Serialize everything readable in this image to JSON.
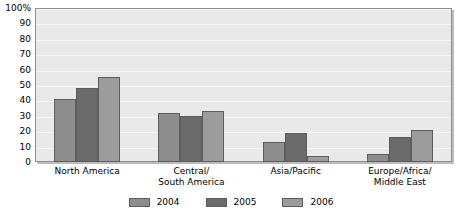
{
  "chart_data": {
    "type": "bar",
    "title": "",
    "subtitle": "",
    "xlabel": "",
    "ylabel": "",
    "ylim": [
      0,
      100
    ],
    "y_unit": "%",
    "grid": true,
    "legend_position": "bottom",
    "categories": [
      "North America",
      "Central/\nSouth America",
      "Asia/Pacific",
      "Europe/Africa/\nMiddle East"
    ],
    "y_ticks": [
      "0",
      "10",
      "20",
      "30",
      "40",
      "50",
      "60",
      "70",
      "80",
      "90",
      "100%"
    ],
    "y_tick_values": [
      0,
      10,
      20,
      30,
      40,
      50,
      60,
      70,
      80,
      90,
      100
    ],
    "series": [
      {
        "name": "2004",
        "color": "#8d8d8d",
        "values": [
          41,
          32,
          13,
          5
        ]
      },
      {
        "name": "2005",
        "color": "#6b6b6b",
        "values": [
          48,
          30,
          19,
          16
        ]
      },
      {
        "name": "2006",
        "color": "#9c9c9c",
        "values": [
          55,
          33,
          4,
          21
        ]
      }
    ]
  },
  "legend": {
    "items": [
      {
        "label": "2004",
        "series_class": "s2004"
      },
      {
        "label": "2005",
        "series_class": "s2005"
      },
      {
        "label": "2006",
        "series_class": "s2006"
      }
    ]
  }
}
